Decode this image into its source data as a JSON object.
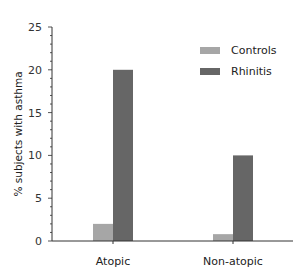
{
  "chart_data": {
    "type": "bar",
    "title": "",
    "xlabel": "",
    "ylabel": "% subjects with asthma",
    "categories": [
      "Atopic",
      "Non-atopic"
    ],
    "series": [
      {
        "name": "Controls",
        "color": "#a6a6a6",
        "values": [
          2,
          0.8
        ]
      },
      {
        "name": "Rhinitis",
        "color": "#666666",
        "values": [
          20,
          10
        ]
      }
    ],
    "ylim": [
      0,
      25
    ],
    "yticks": [
      0,
      5,
      10,
      15,
      20,
      25
    ],
    "minor_ticks_per_major": 5,
    "grid": false,
    "legend_position": "upper right"
  }
}
